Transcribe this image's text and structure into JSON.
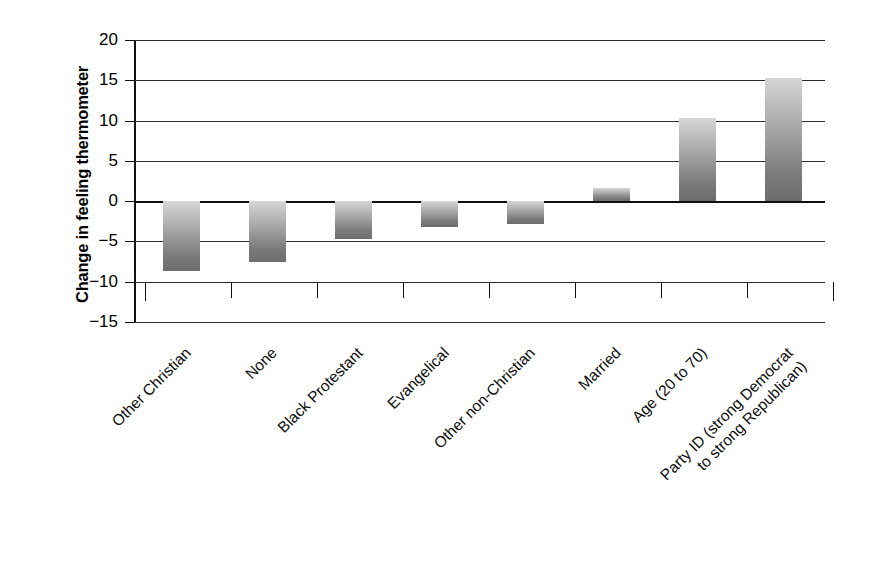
{
  "chart_data": {
    "type": "bar",
    "title": "",
    "xlabel": "",
    "ylabel": "Change in feeling thermometer",
    "ylim": [
      -15,
      20
    ],
    "ytick_values": [
      20,
      15,
      10,
      5,
      0,
      -5,
      -10,
      -15
    ],
    "ytick_labels": [
      "20",
      "15",
      "10",
      "5",
      "0",
      "−5",
      "−10",
      "−15"
    ],
    "grid": true,
    "legend": "none",
    "categories": [
      "Other Christian",
      "None",
      "Black Protestant",
      "Evangelical",
      "Other non-Christian",
      "Married",
      "Age (20 to 70)",
      "Party ID (strong Democrat\nto strong Republican)"
    ],
    "values": [
      -8.7,
      -7.6,
      -4.7,
      -3.2,
      -2.8,
      1.6,
      10.3,
      15.3
    ],
    "bar_colors": {
      "gradient_top": "#d6d6d6",
      "gradient_bottom": "#6d6d6d"
    },
    "axis_color": "#101010"
  }
}
